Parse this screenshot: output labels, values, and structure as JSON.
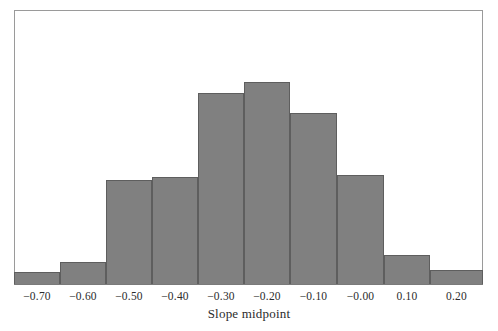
{
  "figure": {
    "background_color": "#ffffff",
    "frame_color": "#9a9a9a",
    "bar_fill_color": "#808080",
    "bar_edge_color": "#5e5e5e",
    "text_color": "#2b2b2b"
  },
  "axis": {
    "x_title": "Slope midpoint"
  },
  "chart_data": {
    "type": "bar",
    "title": "",
    "xlabel": "Slope midpoint",
    "ylabel": "",
    "grid": false,
    "legend": null,
    "categories": [
      "-0.70",
      "-0.60",
      "-0.50",
      "-0.40",
      "-0.30",
      "-0.20",
      "-0.10",
      "-0.00",
      "0.10",
      "0.20"
    ],
    "values": [
      13,
      23,
      105,
      108,
      192,
      203,
      172,
      110,
      30,
      15
    ],
    "ylim": [
      0,
      275
    ],
    "xlim": [
      -0.75,
      0.25
    ],
    "bin_width": 0.1,
    "bar_pixel_heights": [
      13,
      23,
      105,
      108,
      192,
      203,
      172,
      110,
      30,
      15
    ]
  }
}
